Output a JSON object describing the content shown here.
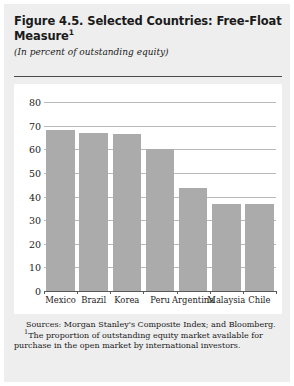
{
  "figure": {
    "title": "Figure 4.5. Selected Countries: Free-Float Measure",
    "title_footnote_marker": "1",
    "subtitle": "(In percent of outstanding equity)",
    "sources": "Sources: Morgan Stanley's Composite Index; and Bloomberg.",
    "footnote_marker": "1",
    "footnote": "The proportion of outstanding equity market available for purchase in the open market by international investors."
  },
  "chart_data": {
    "type": "bar",
    "title": "Figure 4.5. Selected Countries: Free-Float Measure",
    "subtitle": "(In percent of outstanding equity)",
    "categories": [
      "Mexico",
      "Brazil",
      "Korea",
      "Peru",
      "Argentina",
      "Malaysia",
      "Chile"
    ],
    "values": [
      68,
      67,
      66.5,
      60,
      43.5,
      37,
      37
    ],
    "xlabel": "",
    "ylabel": "",
    "ylim": [
      0,
      80
    ],
    "yticks": [
      0,
      10,
      20,
      30,
      40,
      50,
      60,
      70,
      80
    ],
    "ytick_labels": [
      "0",
      "10",
      "20",
      "30",
      "40",
      "50",
      "60",
      "70",
      "80"
    ],
    "grid": true,
    "legend": false,
    "bar_color": "#ababab"
  },
  "colors": {
    "panel_background": "#eeeeee",
    "plot_background": "#ffffff",
    "bar": "#ababab",
    "gridline": "#b9b9b9",
    "axis": "#5a5a5a",
    "rule": "#4a4a4a",
    "text": "#1a1a1a"
  }
}
